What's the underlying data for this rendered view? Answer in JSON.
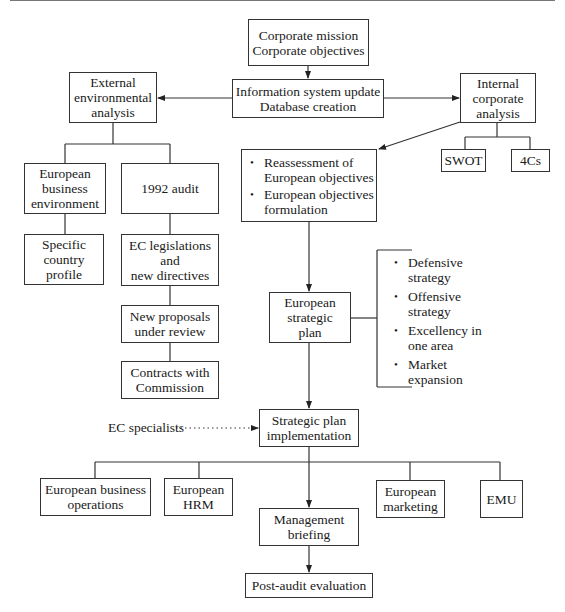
{
  "diagram": {
    "nodes": {
      "corporate": {
        "lines": [
          "Corporate mission",
          "Corporate objectives"
        ]
      },
      "info_system": {
        "lines": [
          "Information system update",
          "Database creation"
        ]
      },
      "external": {
        "lines": [
          "External",
          "environmental",
          "analysis"
        ]
      },
      "internal": {
        "lines": [
          "Internal",
          "corporate",
          "analysis"
        ]
      },
      "swot": {
        "lines": [
          "SWOT"
        ]
      },
      "fourcs": {
        "lines": [
          "4Cs"
        ]
      },
      "eu_business_env": {
        "lines": [
          "European",
          "business",
          "environment"
        ]
      },
      "audit_1992": {
        "lines": [
          "1992 audit"
        ]
      },
      "country_profile": {
        "lines": [
          "Specific",
          "country",
          "profile"
        ]
      },
      "ec_legislations": {
        "lines": [
          "EC legislations",
          "and",
          "new directives"
        ]
      },
      "new_proposals": {
        "lines": [
          "New proposals",
          "under review"
        ]
      },
      "contracts": {
        "lines": [
          "Contracts with",
          "Commission"
        ]
      },
      "reassessment": {
        "bullets": [
          {
            "lines": [
              "Reassessment of",
              "European objectives"
            ]
          },
          {
            "lines": [
              "European objectives",
              "formulation"
            ]
          }
        ]
      },
      "eu_strategic_plan": {
        "lines": [
          "European",
          "strategic",
          "plan"
        ]
      },
      "strategies": {
        "bullets": [
          {
            "lines": [
              "Defensive",
              "strategy"
            ]
          },
          {
            "lines": [
              "Offensive",
              "strategy"
            ]
          },
          {
            "lines": [
              "Excellency in",
              "one area"
            ]
          },
          {
            "lines": [
              "Market",
              "expansion"
            ]
          }
        ]
      },
      "ec_specialists": {
        "label": "EC specialists"
      },
      "implementation": {
        "lines": [
          "Strategic plan",
          "implementation"
        ]
      },
      "eu_business_ops": {
        "lines": [
          "European business",
          "operations"
        ]
      },
      "eu_hrm": {
        "lines": [
          "European",
          "HRM"
        ]
      },
      "mgmt_briefing": {
        "lines": [
          "Management",
          "briefing"
        ]
      },
      "eu_marketing": {
        "lines": [
          "European",
          "marketing"
        ]
      },
      "emu": {
        "lines": [
          "EMU"
        ]
      },
      "post_audit": {
        "lines": [
          "Post-audit evaluation"
        ]
      }
    },
    "edges": [
      {
        "from": "corporate",
        "to": "info_system",
        "style": "arrow"
      },
      {
        "from": "info_system",
        "to": "external",
        "style": "arrow"
      },
      {
        "from": "info_system",
        "to": "internal",
        "style": "arrow"
      },
      {
        "from": "external",
        "to": "eu_business_env",
        "style": "line"
      },
      {
        "from": "external",
        "to": "audit_1992",
        "style": "line"
      },
      {
        "from": "eu_business_env",
        "to": "country_profile",
        "style": "line"
      },
      {
        "from": "audit_1992",
        "to": "ec_legislations",
        "style": "line"
      },
      {
        "from": "ec_legislations",
        "to": "new_proposals",
        "style": "line"
      },
      {
        "from": "new_proposals",
        "to": "contracts",
        "style": "line"
      },
      {
        "from": "internal",
        "to": "swot",
        "style": "line"
      },
      {
        "from": "internal",
        "to": "fourcs",
        "style": "line"
      },
      {
        "from": "internal",
        "to": "reassessment",
        "style": "arrow"
      },
      {
        "from": "reassessment",
        "to": "eu_strategic_plan",
        "style": "arrow"
      },
      {
        "from": "eu_strategic_plan",
        "to": "strategies",
        "style": "bracket"
      },
      {
        "from": "eu_strategic_plan",
        "to": "implementation",
        "style": "arrow"
      },
      {
        "from": "ec_specialists",
        "to": "implementation",
        "style": "dotted-arrow"
      },
      {
        "from": "implementation",
        "to": "eu_business_ops",
        "style": "line"
      },
      {
        "from": "implementation",
        "to": "eu_hrm",
        "style": "line"
      },
      {
        "from": "implementation",
        "to": "mgmt_briefing",
        "style": "arrow"
      },
      {
        "from": "implementation",
        "to": "eu_marketing",
        "style": "line"
      },
      {
        "from": "implementation",
        "to": "emu",
        "style": "line"
      },
      {
        "from": "mgmt_briefing",
        "to": "post_audit",
        "style": "arrow"
      }
    ]
  }
}
